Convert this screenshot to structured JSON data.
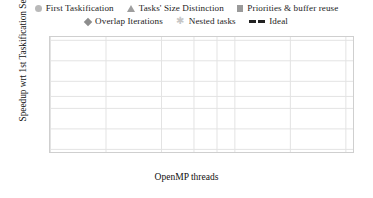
{
  "chart_data": {
    "type": "line",
    "title": "",
    "xlabel": "OpenMP threads",
    "ylabel": "Speedup wrt 1st Taskification Seq.",
    "xscale": "log",
    "yscale": "log",
    "xlim": [
      1,
      44
    ],
    "ylim": [
      0.9,
      44
    ],
    "xticks": [
      1,
      2,
      4,
      6,
      8,
      10,
      20,
      40
    ],
    "xticklabels": [
      "1",
      "2",
      "4",
      "6",
      "8",
      "10",
      "20",
      "40"
    ],
    "yticks": [
      1,
      2,
      4,
      6,
      10,
      20,
      40
    ],
    "yticklabels": [
      "1",
      "2",
      "4",
      "6",
      "10",
      "20",
      "40"
    ],
    "grid": true,
    "legend_position": "above-plot",
    "x": [
      1,
      2,
      4,
      8,
      16,
      20,
      40
    ],
    "series": [
      {
        "name": "First Taskification",
        "marker": "circle",
        "color": "#b9b9b9",
        "values": [
          1.0,
          1.85,
          3.7,
          6.3,
          9.2,
          9.7,
          5.8
        ]
      },
      {
        "name": "Tasks' Size Distinction",
        "marker": "triangle",
        "color": "#9e9e9e",
        "values": [
          1.0,
          1.9,
          3.8,
          6.9,
          10.1,
          10.6,
          9.8
        ]
      },
      {
        "name": "Priorities & buffer reuse",
        "marker": "square",
        "color": "#9a9a9a",
        "values": [
          1.0,
          1.9,
          3.8,
          7.0,
          11.0,
          12.2,
          16.7
        ]
      },
      {
        "name": "Overlap Iterations",
        "marker": "diamond",
        "color": "#8d8d8d",
        "values": [
          1.0,
          1.9,
          3.85,
          7.1,
          11.2,
          12.4,
          19.3
        ]
      },
      {
        "name": "Nested tasks",
        "marker": "star",
        "color": "#c6c6c6",
        "values": [
          1.0,
          1.88,
          3.75,
          6.95,
          11.0,
          12.2,
          16.4
        ]
      },
      {
        "name": "Ideal",
        "marker": "dashed-line",
        "color": "#1a1a1a",
        "linestyle": "dashed",
        "values": [
          1.0,
          2.0,
          4.0,
          8.0,
          16.0,
          20.0,
          40.0
        ]
      }
    ]
  },
  "legend": {
    "row1": [
      {
        "label": "First Taskification",
        "marker": "circle-marker-icon"
      },
      {
        "label": "Tasks' Size Distinction",
        "marker": "triangle-marker-icon"
      },
      {
        "label": "Priorities & buffer reuse",
        "marker": "square-marker-icon"
      }
    ],
    "row2": [
      {
        "label": "Overlap Iterations",
        "marker": "diamond-marker-icon"
      },
      {
        "label": "Nested tasks",
        "marker": "star-marker-icon"
      },
      {
        "label": "Ideal",
        "marker": "dashed-line-marker-icon"
      }
    ]
  },
  "axes": {
    "x_label": "OpenMP threads",
    "y_label": "Speedup wrt 1st Taskification Seq.",
    "x_ticks": [
      "1",
      "2",
      "4",
      "6",
      "8",
      "10",
      "20",
      "40"
    ],
    "y_ticks": [
      "40",
      "20",
      "10",
      "6",
      "4",
      "2",
      "1"
    ]
  }
}
